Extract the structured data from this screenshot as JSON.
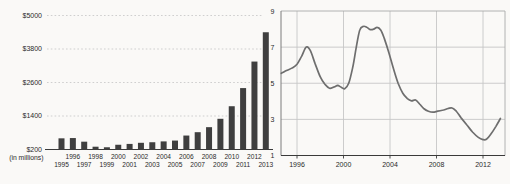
{
  "figure": {
    "background": "#faf9f7",
    "bar_color": "#3f3f3f",
    "line_color": "#6e6e6e",
    "left_grid_color": "#c9c9c9",
    "right_grid_color": "#c6c6c6",
    "axis_color": "#3a3a3a",
    "frame_color": "#a9a9a9",
    "text_color": "#2a2a2a"
  },
  "chart_data": [
    {
      "type": "bar",
      "title": "",
      "xlabel": "",
      "ylabel": "",
      "unit_note": "(in millions)",
      "categories": [
        1995,
        1996,
        1997,
        1998,
        1999,
        2000,
        2001,
        2002,
        2003,
        2004,
        2005,
        2006,
        2007,
        2008,
        2009,
        2010,
        2011,
        2012,
        2013
      ],
      "values": [
        600,
        610,
        480,
        300,
        280,
        370,
        400,
        440,
        460,
        490,
        520,
        700,
        820,
        1000,
        1300,
        1750,
        2400,
        3350,
        4400
      ],
      "y_ticks": [
        200,
        1400,
        2600,
        3800,
        5000
      ],
      "y_tick_labels": [
        "$200",
        "$1400",
        "$2600",
        "$3800",
        "$5000"
      ],
      "ylim": [
        200,
        5000
      ],
      "x_tick_row_upper": [
        1996,
        1998,
        2000,
        2002,
        2004,
        2006,
        2008,
        2010,
        2012
      ],
      "x_tick_row_lower": [
        1995,
        1997,
        1999,
        2001,
        2003,
        2005,
        2007,
        2009,
        2011,
        2013
      ],
      "grid": "horizontal-dotted",
      "legend": "none"
    },
    {
      "type": "line",
      "title": "",
      "xlabel": "",
      "ylabel": "",
      "x": [
        1994.65,
        1995.1,
        1995.6,
        1996.0,
        1996.4,
        1996.8,
        1997.15,
        1997.55,
        1998.0,
        1998.4,
        1998.8,
        1999.2,
        1999.5,
        1999.8,
        2000.1,
        2000.45,
        2000.8,
        2001.1,
        2001.4,
        2001.7,
        2002.0,
        2002.3,
        2002.6,
        2002.9,
        2003.2,
        2003.5,
        2003.9,
        2004.3,
        2004.7,
        2005.1,
        2005.5,
        2005.85,
        2006.2,
        2006.55,
        2006.9,
        2007.3,
        2007.7,
        2008.1,
        2008.6,
        2009.0,
        2009.35,
        2009.7,
        2010.1,
        2010.6,
        2011.1,
        2011.6,
        2012.0,
        2012.3,
        2012.7,
        2013.1,
        2013.5
      ],
      "y": [
        5.55,
        5.7,
        5.85,
        6.05,
        6.5,
        7.0,
        6.8,
        6.1,
        5.35,
        4.95,
        4.72,
        4.8,
        4.88,
        4.78,
        4.7,
        5.0,
        5.9,
        7.0,
        7.95,
        8.15,
        8.1,
        7.97,
        8.0,
        8.1,
        7.95,
        7.5,
        6.7,
        5.8,
        5.0,
        4.45,
        4.15,
        4.03,
        4.07,
        3.85,
        3.6,
        3.45,
        3.4,
        3.45,
        3.52,
        3.6,
        3.63,
        3.45,
        3.1,
        2.7,
        2.3,
        2.0,
        1.88,
        1.9,
        2.2,
        2.6,
        3.05
      ],
      "y_ticks": [
        1,
        3,
        5,
        7,
        9
      ],
      "y_tick_labels": [
        "1",
        "3",
        "5",
        "7",
        "9"
      ],
      "x_ticks": [
        1996,
        2000,
        2004,
        2008,
        2012
      ],
      "x_tick_labels": [
        "1996",
        "2000",
        "2004",
        "2008",
        "2012"
      ],
      "xlim": [
        1994.6,
        2013.9
      ],
      "ylim": [
        1,
        9
      ],
      "grid": true,
      "legend": "none"
    }
  ]
}
